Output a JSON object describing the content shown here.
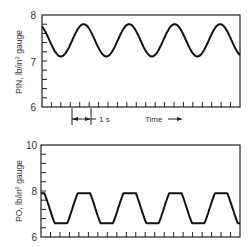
{
  "chart_data": [
    {
      "type": "line",
      "title": "",
      "xlabel": "Time",
      "ylabel": "PIN, lb/in² gauge",
      "ylabel_parts": {
        "main": "PIN, lb/in",
        "sup": "2",
        "tail": " gauge"
      },
      "ylim": [
        6,
        8
      ],
      "yticks": [
        "6",
        "7",
        "8"
      ],
      "annotation_scale": "1 s",
      "annotation_time": "Time",
      "series": [
        {
          "name": "PIN",
          "shape": "sinusoid",
          "min": 7.1,
          "max": 7.8,
          "start": 7.75,
          "period_s": 1.1,
          "cycles_visible": 4
        }
      ]
    },
    {
      "type": "line",
      "title": "",
      "xlabel": "",
      "ylabel": "PO, lb/in² gauge",
      "ylabel_parts": {
        "main": "PO, lb/in",
        "sup": "2",
        "tail": " gauge"
      },
      "ylim": [
        6,
        10
      ],
      "yticks": [
        "6",
        "8",
        "10"
      ],
      "series": [
        {
          "name": "PO",
          "shape": "clipped-sinusoid",
          "min": 6.6,
          "max": 7.9,
          "start": 7.85,
          "period_s": 1.1,
          "cycles_visible": 4
        }
      ]
    }
  ]
}
